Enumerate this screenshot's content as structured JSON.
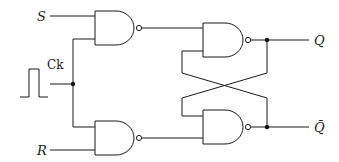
{
  "diagram": {
    "type": "clocked SR flip-flop (NAND gates)",
    "labels": {
      "set_input": "S",
      "reset_input": "R",
      "clock": "Ck",
      "output": "Q",
      "output_complement": "Q̄"
    },
    "gates": [
      {
        "id": "gate-steering-top",
        "kind": "NAND",
        "inputs": [
          "S",
          "Ck"
        ]
      },
      {
        "id": "gate-steering-bottom",
        "kind": "NAND",
        "inputs": [
          "Ck",
          "R"
        ]
      },
      {
        "id": "gate-latch-top",
        "kind": "NAND",
        "inputs": [
          "gate-steering-top",
          "Q̄"
        ],
        "output": "Q"
      },
      {
        "id": "gate-latch-bottom",
        "kind": "NAND",
        "inputs": [
          "Q",
          "gate-steering-bottom"
        ],
        "output": "Q̄"
      }
    ],
    "colors": {
      "line": "#1a1a1a",
      "background": "#ffffff"
    }
  }
}
